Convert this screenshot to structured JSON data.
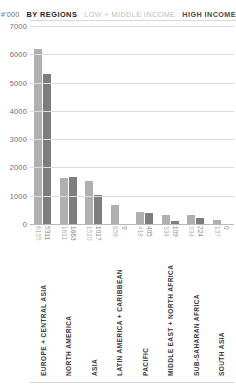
{
  "header": {
    "unit": "#'000",
    "by_regions": "BY REGIONS",
    "legend_low": "LOW + MIDDLE INCOME",
    "legend_high": "HIGH INCOME"
  },
  "colors": {
    "low": "#b0b0b0",
    "high": "#7d7d7d",
    "grid": "#dcdcdc",
    "axis": "#b9b9b9",
    "text": "#3b3b3b",
    "muted": "#6e6e6e"
  },
  "chart_data": {
    "type": "bar",
    "title": "BY REGIONS",
    "xlabel": "",
    "ylabel": "#'000",
    "ylim": [
      0,
      7000
    ],
    "yticks": [
      0,
      1000,
      2000,
      3000,
      4000,
      5000,
      6000,
      7000
    ],
    "ytick_labels": [
      "0",
      "1000",
      "2000",
      "3000",
      "4000",
      "5000",
      "6000",
      "7000"
    ],
    "grid": true,
    "legend_position": "top-right",
    "categories": [
      "EUROPE + CENTRAL ASIA",
      "NORTH AMERICA",
      "ASIA",
      "LATIN AMERICA + CARIBBEAN",
      "PACIFIC",
      "MIDDLE EAST + NORTH AFRICA",
      "SUB-SAHARAN AFRICA",
      "SOUTH ASIA"
    ],
    "series": [
      {
        "name": "LOW + MIDDLE INCOME",
        "color": "#b0b0b0",
        "values": [
          6195,
          1611,
          1510,
          658,
          418,
          334,
          334,
          137
        ]
      },
      {
        "name": "HIGH INCOME",
        "color": "#7d7d7d",
        "values": [
          5311,
          1663,
          1017,
          9,
          405,
          109,
          224,
          0
        ]
      }
    ]
  }
}
